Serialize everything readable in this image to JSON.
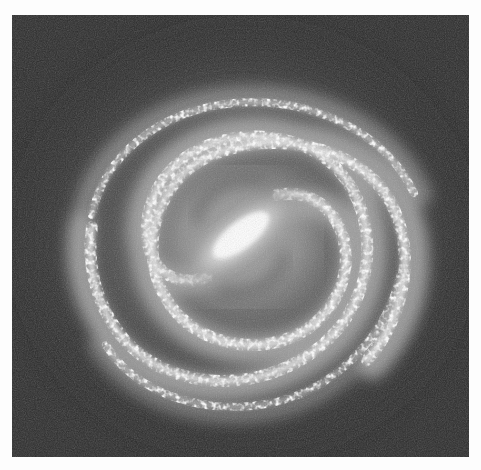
{
  "image": {
    "subject": "barred spiral galaxy",
    "rendering": "grayscale",
    "alt_text": "Grayscale illustration of a barred spiral galaxy with a bright central bar and several winding spiral arms",
    "colors": {
      "page_background": "#fdfdfd",
      "space_background": "#2a2a2a",
      "core_highlight": "#ffffff",
      "arm_glow": "#bdbdbd"
    }
  }
}
